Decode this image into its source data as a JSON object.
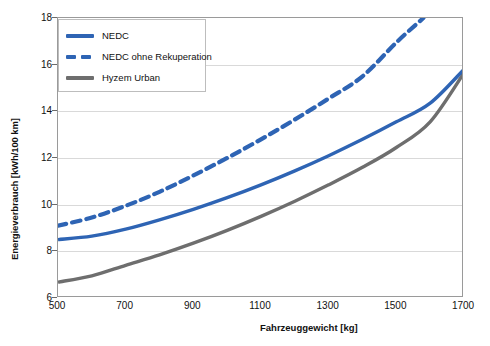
{
  "chart_data": {
    "type": "line",
    "title": "",
    "xlabel": "Fahrzeuggewicht [kg]",
    "ylabel": "Energieverbrauch [kWh/100 km]",
    "xlim": [
      500,
      1700
    ],
    "ylim": [
      6,
      18
    ],
    "xticks": [
      500,
      700,
      900,
      1100,
      1300,
      1500,
      1700
    ],
    "yticks": [
      6,
      8,
      10,
      12,
      14,
      16,
      18
    ],
    "grid": "horizontal",
    "legend_position": "upper-left",
    "series": [
      {
        "name": "NEDC",
        "style": "solid",
        "color": "#2e64b4",
        "x": [
          500,
          600,
          700,
          800,
          900,
          1000,
          1100,
          1200,
          1300,
          1400,
          1500,
          1600,
          1700
        ],
        "values": [
          8.5,
          8.65,
          8.95,
          9.35,
          9.8,
          10.3,
          10.85,
          11.45,
          12.1,
          12.8,
          13.55,
          14.35,
          15.8
        ]
      },
      {
        "name": "NEDC ohne Rekuperation",
        "style": "dashed",
        "color": "#2e64b4",
        "x": [
          500,
          600,
          700,
          800,
          900,
          1000,
          1100,
          1200,
          1300,
          1400,
          1500,
          1580
        ],
        "values": [
          9.1,
          9.45,
          9.95,
          10.55,
          11.25,
          12.0,
          12.8,
          13.65,
          14.55,
          15.5,
          16.95,
          18.0
        ]
      },
      {
        "name": "Hyzem Urban",
        "style": "solid",
        "color": "#6e6e6e",
        "x": [
          500,
          600,
          700,
          800,
          900,
          1000,
          1100,
          1200,
          1300,
          1400,
          1500,
          1600,
          1700
        ],
        "values": [
          6.68,
          6.95,
          7.4,
          7.85,
          8.35,
          8.9,
          9.5,
          10.15,
          10.85,
          11.6,
          12.45,
          13.55,
          15.65
        ]
      }
    ]
  },
  "legend": {
    "items": [
      {
        "label": "NEDC",
        "swatch": "solid-blue"
      },
      {
        "label": "NEDC ohne Rekuperation",
        "swatch": "dash-blue"
      },
      {
        "label": "Hyzem Urban",
        "swatch": "solid-gray"
      }
    ]
  },
  "axes": {
    "y_title": "Energieverbrauch [kWh/100 km]",
    "x_title": "Fahrzeuggewicht [kg]",
    "y_tick_labels": [
      "18",
      "16",
      "14",
      "12",
      "10",
      "8",
      "6"
    ],
    "x_tick_labels": [
      "500",
      "700",
      "900",
      "1100",
      "1300",
      "1500",
      "1700"
    ]
  },
  "colors": {
    "nedc_blue": "#2e64b4",
    "hyzem_gray": "#6e6e6e",
    "grid": "#d9d9d9",
    "frame": "#9a9a9a",
    "background": "#ffffff"
  }
}
